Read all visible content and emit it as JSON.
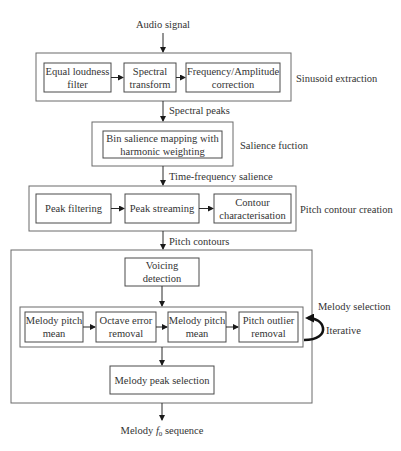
{
  "input_label": "Audio signal",
  "output": {
    "prefix": "Melody ",
    "symbol": "f",
    "subscript": "0",
    "suffix": " sequence"
  },
  "stages": [
    {
      "id": "sinusoid-extraction",
      "label": "Sinusoid extraction",
      "blocks": [
        {
          "lines": [
            "Equal loudness",
            "filter"
          ]
        },
        {
          "lines": [
            "Spectral",
            "transform"
          ]
        },
        {
          "lines": [
            "Frequency/Amplitude",
            "correction"
          ]
        }
      ],
      "output_label": "Spectral peaks"
    },
    {
      "id": "salience-function",
      "label": "Salience fuction",
      "blocks": [
        {
          "lines": [
            "Bin salience mapping with",
            "harmonic weighting"
          ]
        }
      ],
      "output_label": "Time-frequency salience"
    },
    {
      "id": "pitch-contour-creation",
      "label": "Pitch contour creation",
      "blocks": [
        {
          "lines": [
            "Peak filtering"
          ]
        },
        {
          "lines": [
            "Peak streaming"
          ]
        },
        {
          "lines": [
            "Contour",
            "characterisation"
          ]
        }
      ],
      "output_label": "Pitch contours"
    },
    {
      "id": "melody-selection",
      "label": "Melody selection",
      "voicing": {
        "lines": [
          "Voicing",
          "detection"
        ]
      },
      "iterative_label": "Iterative",
      "iterative_blocks": [
        {
          "lines": [
            "Melody pitch",
            "mean"
          ]
        },
        {
          "lines": [
            "Octave error",
            "removal"
          ]
        },
        {
          "lines": [
            "Melody pitch",
            "mean"
          ]
        },
        {
          "lines": [
            "Pitch outlier",
            "removal"
          ]
        }
      ],
      "final_block": {
        "lines": [
          "Melody peak selection"
        ]
      }
    }
  ],
  "colors": {
    "stroke": "#4a4a4a",
    "text": "#333333",
    "background": "#ffffff"
  }
}
